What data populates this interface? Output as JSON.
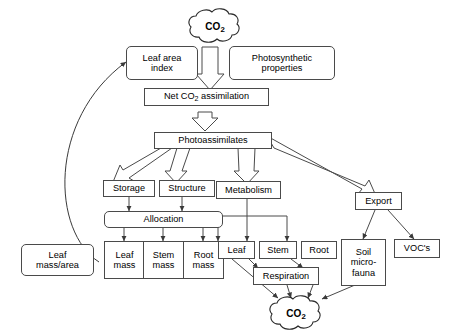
{
  "diagram": {
    "type": "flow-diagram",
    "background_color": "#ffffff",
    "line_color": "#4a4a4a",
    "text_color": "#000000"
  },
  "clouds": [
    {
      "id": "co2-source",
      "label_main": "CO",
      "label_sub": "2"
    },
    {
      "id": "co2-sink",
      "label_main": "CO",
      "label_sub": "2"
    }
  ],
  "nodes": [
    {
      "id": "leaf-area-index",
      "label": "Leaf area\nindex"
    },
    {
      "id": "photosynthetic-properties",
      "label": "Photosynthetic\nproperties"
    },
    {
      "id": "net-co2-assimilation",
      "label_pre": "Net CO",
      "label_sub": "2",
      "label_post": " assimilation"
    },
    {
      "id": "photoassimilates",
      "label": "Photoassimilates"
    },
    {
      "id": "storage",
      "label": "Storage"
    },
    {
      "id": "structure",
      "label": "Structure"
    },
    {
      "id": "metabolism",
      "label": "Metabolism"
    },
    {
      "id": "export",
      "label": "Export"
    },
    {
      "id": "allocation",
      "label": "Allocation"
    },
    {
      "id": "leaf-mass-area",
      "label": "Leaf\nmass/area"
    },
    {
      "id": "leaf-mass",
      "label": "Leaf\nmass"
    },
    {
      "id": "stem-mass",
      "label": "Stem\nmass"
    },
    {
      "id": "root-mass",
      "label": "Root\nmass"
    },
    {
      "id": "leaf",
      "label": "Leaf"
    },
    {
      "id": "stem",
      "label": "Stem"
    },
    {
      "id": "root",
      "label": "Root"
    },
    {
      "id": "respiration",
      "label": "Respiration"
    },
    {
      "id": "soil-microfauna",
      "label": "Soil\nmicro-\nfauna"
    },
    {
      "id": "vocs",
      "label": "VOC's"
    }
  ],
  "edges": [
    {
      "from": "co2-source",
      "to": "net-co2-assimilation",
      "style": "block-arrow"
    },
    {
      "from": "net-co2-assimilation",
      "to": "photoassimilates",
      "style": "block-arrow"
    },
    {
      "from": "photoassimilates",
      "to": "storage",
      "style": "block-arrow"
    },
    {
      "from": "photoassimilates",
      "to": "structure",
      "style": "block-arrow"
    },
    {
      "from": "photoassimilates",
      "to": "metabolism",
      "style": "block-arrow"
    },
    {
      "from": "photoassimilates",
      "to": "export",
      "style": "block-arrow"
    },
    {
      "from": "storage",
      "to": "allocation",
      "style": "line-arrow"
    },
    {
      "from": "structure",
      "to": "allocation",
      "style": "line-arrow"
    },
    {
      "from": "allocation",
      "to": "leaf-mass",
      "style": "line-arrow"
    },
    {
      "from": "allocation",
      "to": "stem-mass",
      "style": "line-arrow"
    },
    {
      "from": "allocation",
      "to": "root-mass",
      "style": "line-arrow"
    },
    {
      "from": "leaf-mass",
      "to": "leaf-area-index",
      "style": "curved-feedback-arrow"
    },
    {
      "from": "metabolism",
      "to": "leaf",
      "style": "line-arrow"
    },
    {
      "from": "metabolism",
      "to": "stem",
      "style": "line-arrow"
    },
    {
      "from": "metabolism",
      "to": "root",
      "style": "line-arrow"
    },
    {
      "from": "export",
      "to": "soil-microfauna",
      "style": "line-arrow"
    },
    {
      "from": "export",
      "to": "vocs",
      "style": "line-arrow"
    },
    {
      "from": "stem",
      "to": "respiration",
      "style": "line-arrow"
    },
    {
      "from": "root",
      "to": "respiration",
      "style": "line-arrow"
    },
    {
      "from": "leaf",
      "to": "co2-sink",
      "style": "line-arrow"
    },
    {
      "from": "respiration",
      "to": "co2-sink",
      "style": "line-arrow"
    },
    {
      "from": "soil-microfauna",
      "to": "co2-sink",
      "style": "line-arrow"
    }
  ]
}
